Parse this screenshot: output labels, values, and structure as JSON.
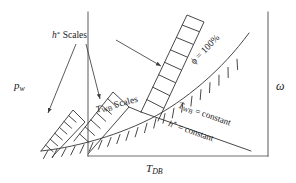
{
  "figure": {
    "type": "diagram",
    "line_color": "#3d3d3d",
    "text_color": "#1a1a1a",
    "background": "#ffffff"
  },
  "axes": {
    "x_label_main": "T",
    "x_label_sub": "DB",
    "y_label_left_main": "p",
    "y_label_left_sub": "w",
    "y_label_right": "ω"
  },
  "annotations": {
    "h_scales_main": "h",
    "h_scales_sup": "*",
    "h_scales_tail": " Scales",
    "twb_scales_main": "T",
    "twb_scales_sub": "WB",
    "twb_scales_tail": " Scales",
    "phi_label": "ϕ = 100%",
    "twb_constant_main": "T",
    "twb_constant_sub": "WB",
    "twb_constant_tail": " = constant",
    "h_constant_main": "h",
    "h_constant_sup": "*",
    "h_constant_tail": " = constant"
  }
}
